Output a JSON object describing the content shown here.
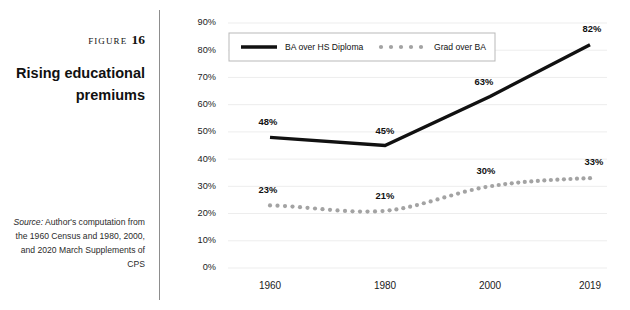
{
  "caption": {
    "figure_word": "Figure",
    "figure_number": "16",
    "title": "Rising educational premiums",
    "source_label": "Source:",
    "source_text": " Author's computation from the 1960 Census and 1980, 2000, and 2020 March Supplements of CPS"
  },
  "colors": {
    "ba_line": "#111111",
    "grad_dots": "#a3a3a3",
    "gridline": "#ededed",
    "divider": "#8d8d8d",
    "legend_border": "#b9b9b9",
    "background": "#ffffff"
  },
  "chart_data": {
    "type": "line",
    "title": "Rising educational premiums",
    "xlabel": "",
    "ylabel": "",
    "categories": [
      "1960",
      "1980",
      "2000",
      "2019"
    ],
    "x": [
      1960,
      1980,
      2000,
      2019
    ],
    "ylim": [
      0,
      90
    ],
    "ytick_labels": [
      "0%",
      "10%",
      "20%",
      "30%",
      "40%",
      "50%",
      "60%",
      "70%",
      "80%",
      "90%"
    ],
    "ytick_values": [
      0,
      10,
      20,
      30,
      40,
      50,
      60,
      70,
      80,
      90
    ],
    "grid": true,
    "grid_axis": "y",
    "legend_position": "top-left-inside",
    "series": [
      {
        "name": "BA over HS Diploma",
        "style": "solid",
        "color": "#111111",
        "values": [
          48,
          45,
          63,
          82
        ],
        "labels": [
          "48%",
          "45%",
          "63%",
          "82%"
        ]
      },
      {
        "name": "Grad over BA",
        "style": "dotted",
        "color": "#a3a3a3",
        "values": [
          23,
          21,
          30,
          33
        ],
        "labels": [
          "23%",
          "21%",
          "30%",
          "33%"
        ]
      }
    ]
  }
}
